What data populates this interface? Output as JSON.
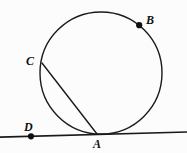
{
  "figure": {
    "type": "geometry-diagram",
    "background_color": "#fcfcfc",
    "stroke_color": "#1a1a1a",
    "labels": {
      "A": "A",
      "B": "B",
      "C": "C",
      "D": "D"
    },
    "elements": {
      "circle": {
        "cx": 101,
        "cy": 73,
        "r": 61
      },
      "tangent_line": {
        "x1": 0,
        "y1": 137,
        "x2": 187,
        "y2": 132
      },
      "chord_CA": {
        "x1": 42,
        "y1": 63,
        "x2": 97,
        "y2": 134
      },
      "point_A": {
        "x": 97,
        "y": 134,
        "dot": false
      },
      "point_B": {
        "x": 139,
        "y": 25,
        "dot": true
      },
      "point_C": {
        "x": 42,
        "y": 63,
        "dot": false
      },
      "point_D": {
        "x": 31,
        "y": 136,
        "dot": true
      }
    }
  }
}
